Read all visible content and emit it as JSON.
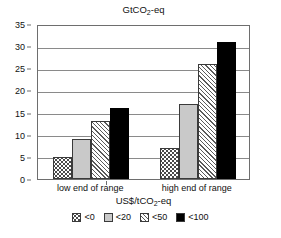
{
  "chart_data": {
    "type": "bar",
    "title": "GtCO2-eq",
    "title_parts": {
      "pre": "GtCO",
      "sub": "2",
      "post": "-eq"
    },
    "xlabel": "US$/tCO2-eq",
    "xlabel_parts": {
      "pre": "US$/tCO",
      "sub": "2",
      "post": "-eq"
    },
    "ylabel": "",
    "categories": [
      "low end of range",
      "high end of range"
    ],
    "series": [
      {
        "name": "<0",
        "values": [
          5,
          7
        ],
        "pattern": "dots",
        "color": "#ffffff"
      },
      {
        "name": "<20",
        "values": [
          9,
          17
        ],
        "pattern": "solid-gray",
        "color": "#c9c9c9"
      },
      {
        "name": "<50",
        "values": [
          13,
          26
        ],
        "pattern": "hatch",
        "color": "#ffffff"
      },
      {
        "name": "<100",
        "values": [
          16,
          31
        ],
        "pattern": "black",
        "color": "#000000"
      }
    ],
    "ylim": [
      0,
      35
    ],
    "yticks": [
      0,
      5,
      10,
      15,
      20,
      25,
      30,
      35
    ],
    "ytick_labels": [
      "0",
      "5",
      "10",
      "15",
      "20",
      "25",
      "30",
      "35"
    ],
    "grid": true,
    "legend_position": "bottom"
  },
  "legend": {
    "items": [
      {
        "label": "<0"
      },
      {
        "label": "<20"
      },
      {
        "label": "<50"
      },
      {
        "label": "<100"
      }
    ]
  }
}
